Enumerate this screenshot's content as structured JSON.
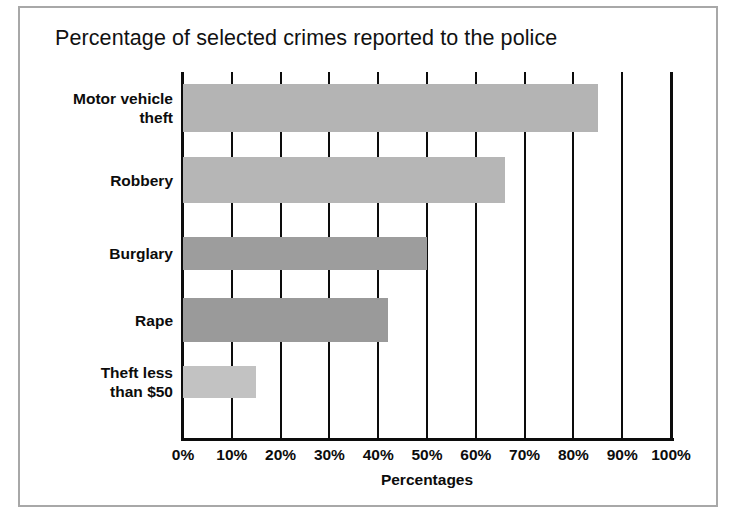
{
  "frame": {
    "border_color": "#a8a8a8",
    "background": "#ffffff"
  },
  "chart_data": {
    "type": "bar",
    "orientation": "horizontal",
    "title": "Percentage of selected crimes reported to the police",
    "xlabel": "Percentages",
    "ylabel": "",
    "categories": [
      "Motor vehicle\ntheft",
      "Robbery",
      "Burglary",
      "Rape",
      "Theft less\nthan $50"
    ],
    "values": [
      85,
      66,
      50,
      42,
      15
    ],
    "xlim": [
      0,
      100
    ],
    "xticks": [
      0,
      10,
      20,
      30,
      40,
      50,
      60,
      70,
      80,
      90,
      100
    ],
    "xtick_labels": [
      "0%",
      "10%",
      "20%",
      "30%",
      "40%",
      "50%",
      "60%",
      "70%",
      "80%",
      "90%",
      "100%"
    ],
    "grid": true,
    "grid_axis": "x",
    "legend": false,
    "bar_colors": [
      "#b4b4b4",
      "#b6b6b6",
      "#9d9d9d",
      "#9a9a9a",
      "#c2c2c2"
    ],
    "grid_color": "#0c0c0c",
    "axis_color": "#0c0c0c",
    "text_color": "#0c0c0c"
  }
}
